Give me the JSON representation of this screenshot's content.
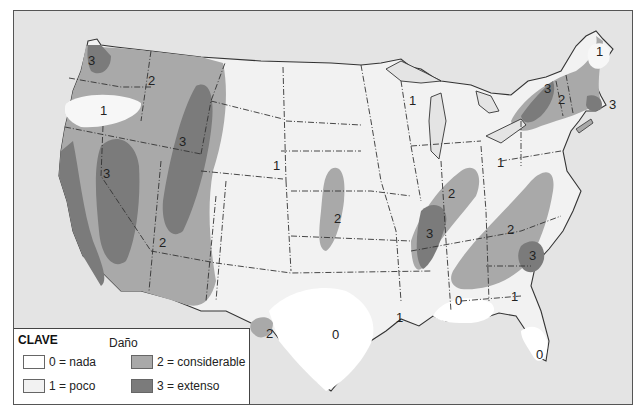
{
  "legend": {
    "title": "CLAVE",
    "subtitle": "Daño",
    "items": [
      {
        "value": "0",
        "label": "0 = nada",
        "color": "#ffffff"
      },
      {
        "value": "1",
        "label": "1 = poco",
        "color": "#f2f2f2"
      },
      {
        "value": "2",
        "label": "2 = considerable",
        "color": "#a9a9a9"
      },
      {
        "value": "3",
        "label": "3 = extenso",
        "color": "#7b7b7b"
      }
    ]
  },
  "colors": {
    "background": "#e4e4e4",
    "level0": "#ffffff",
    "level1": "#f2f2f2",
    "level2": "#a9a9a9",
    "level3": "#7b7b7b",
    "border": "#333333"
  },
  "map_labels": [
    {
      "text": "3",
      "x": 87,
      "y": 64
    },
    {
      "text": "2",
      "x": 147,
      "y": 80
    },
    {
      "text": "1",
      "x": 89,
      "y": 111
    },
    {
      "text": "3",
      "x": 168,
      "y": 137
    },
    {
      "text": "3",
      "x": 92,
      "y": 171
    },
    {
      "text": "2",
      "x": 148,
      "y": 240
    },
    {
      "text": "1",
      "x": 262,
      "y": 165
    },
    {
      "text": "2",
      "x": 322,
      "y": 215
    },
    {
      "text": "2",
      "x": 256,
      "y": 328
    },
    {
      "text": "0",
      "x": 322,
      "y": 331
    },
    {
      "text": "1",
      "x": 399,
      "y": 100
    },
    {
      "text": "1",
      "x": 500,
      "y": 162
    },
    {
      "text": "2",
      "x": 452,
      "y": 194
    },
    {
      "text": "3",
      "x": 428,
      "y": 232
    },
    {
      "text": "2",
      "x": 510,
      "y": 228
    },
    {
      "text": "3",
      "x": 533,
      "y": 252
    },
    {
      "text": "0",
      "x": 459,
      "y": 299
    },
    {
      "text": "1",
      "x": 513,
      "y": 296
    },
    {
      "text": "1",
      "x": 398,
      "y": 316
    },
    {
      "text": "0",
      "x": 538,
      "y": 351
    },
    {
      "text": "3",
      "x": 545,
      "y": 86
    },
    {
      "text": "2",
      "x": 559,
      "y": 96
    },
    {
      "text": "1",
      "x": 599,
      "y": 51
    },
    {
      "text": "3",
      "x": 610,
      "y": 104
    }
  ]
}
